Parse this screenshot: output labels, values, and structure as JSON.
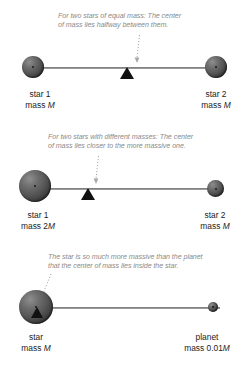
{
  "figure": {
    "title_visible": false,
    "background_color": "#ffffff",
    "text_color": "#1c1c1c",
    "caption_color": "#8a8a8a",
    "sphere_color": "#555555",
    "fulcrum_color": "#111111",
    "beam_color": "#6f6f6f"
  },
  "panels": [
    {
      "id": "equal-mass",
      "caption_line_1": "For two stars of equal mass: The center",
      "caption_line_2": "of mass lies halfway between them.",
      "left_body": {
        "name": "star 1",
        "mass_prefix": "mass ",
        "mass_symbol": "M"
      },
      "right_body": {
        "name": "star 2",
        "mass_prefix": "mass ",
        "mass_symbol": "M"
      },
      "fulcrum_position_percent": 50
    },
    {
      "id": "different-mass",
      "caption_line_1": "For two stars with different masses: The center",
      "caption_line_2": "of mass lies closer to the more massive one.",
      "left_body": {
        "name": "star 1",
        "mass_prefix": "mass 2",
        "mass_symbol": "M"
      },
      "right_body": {
        "name": "star 2",
        "mass_prefix": "mass ",
        "mass_symbol": "M"
      },
      "fulcrum_position_percent": 33
    },
    {
      "id": "star-planet",
      "caption_line_1": "The star is so much more massive than the planet",
      "caption_line_2": "that the center of mass lies inside the star.",
      "left_body": {
        "name": "star",
        "mass_prefix": "mass ",
        "mass_symbol": "M"
      },
      "right_body": {
        "name": "planet",
        "mass_prefix": "mass 0.01",
        "mass_symbol": "M"
      },
      "fulcrum_position_percent": 2
    }
  ]
}
